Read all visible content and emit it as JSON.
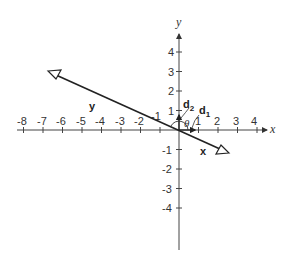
{
  "diagram": {
    "axes": {
      "x_label": "x",
      "y_label": "y",
      "x_ticks": [
        "-8",
        "-7",
        "-6",
        "-5",
        "-4",
        "-3",
        "-2",
        "-1",
        "1",
        "2",
        "3",
        "4"
      ],
      "y_ticks": [
        "4",
        "3",
        "2",
        "1",
        "-1",
        "-2",
        "-3",
        "-4"
      ]
    },
    "line_labels": {
      "rotated_x": "x",
      "rotated_y": "y"
    },
    "vectors": {
      "d1": {
        "base": "d",
        "sub": "1"
      },
      "d2": {
        "base": "d",
        "sub": "2"
      }
    },
    "angle_label": "θ"
  }
}
